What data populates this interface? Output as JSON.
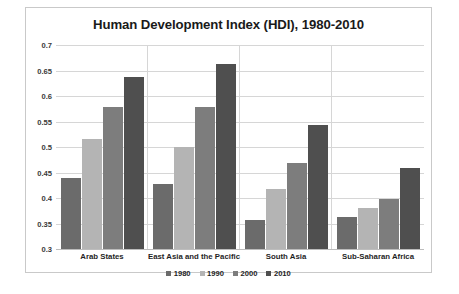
{
  "chart_data": {
    "type": "bar",
    "title": "Human Development Index (HDI), 1980-2010",
    "xlabel": "",
    "ylabel": "",
    "ylim": [
      0.3,
      0.7
    ],
    "yticks": [
      0.3,
      0.35,
      0.4,
      0.45,
      0.5,
      0.55,
      0.6,
      0.65,
      0.7
    ],
    "ytick_labels": [
      "0.3",
      "0.35",
      "0.4",
      "0.45",
      "0.5",
      "0.55",
      "0.6",
      "0.65",
      "0.7"
    ],
    "grid": true,
    "legend_position": "bottom",
    "categories": [
      "Arab States",
      "East Asia and the Pacific",
      "South Asia",
      "Sub-Saharan Africa"
    ],
    "series": [
      {
        "name": "1980",
        "color": "#6b6b6b",
        "values": [
          0.44,
          0.427,
          0.357,
          0.363
        ]
      },
      {
        "name": "1990",
        "color": "#b4b4b4",
        "values": [
          0.515,
          0.5,
          0.417,
          0.38
        ]
      },
      {
        "name": "2000",
        "color": "#7d7d7d",
        "values": [
          0.578,
          0.578,
          0.468,
          0.398
        ]
      },
      {
        "name": "2010",
        "color": "#4f4f4f",
        "values": [
          0.638,
          0.662,
          0.543,
          0.458
        ]
      }
    ]
  },
  "caption": ""
}
